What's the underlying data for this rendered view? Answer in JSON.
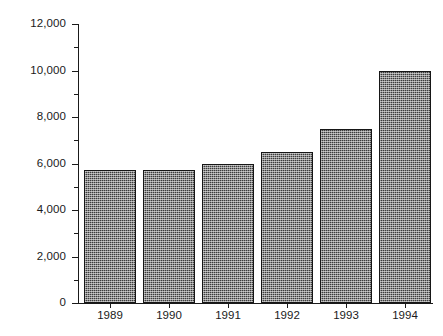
{
  "chart_data": {
    "type": "bar",
    "title": "",
    "subtitle": "",
    "xlabel": "",
    "ylabel": "",
    "categories": [
      "1989",
      "1990",
      "1991",
      "1992",
      "1993",
      "1994"
    ],
    "values": [
      5700,
      5700,
      6000,
      6500,
      7500,
      10000
    ],
    "series": [
      {
        "name": "",
        "values": [
          5700,
          5700,
          6000,
          6500,
          7500,
          10000
        ]
      }
    ],
    "ylim": [
      0,
      12000
    ],
    "y_major_ticks": [
      0,
      2000,
      4000,
      6000,
      8000,
      10000,
      12000
    ],
    "y_tick_labels": [
      "0",
      "2,000",
      "4,000",
      "6,000",
      "8,000",
      "10,000",
      "12,000"
    ],
    "y_minor_ticks": [
      1000,
      3000,
      5000,
      7000,
      9000,
      11000
    ],
    "grid": false,
    "legend": false,
    "legend_position": "none",
    "bar_fill_color": "#3c3c3c",
    "bar_edge_color": "#161616",
    "axis_color": "#1a1a1a",
    "background_color": "#ffffff",
    "annotations": []
  }
}
